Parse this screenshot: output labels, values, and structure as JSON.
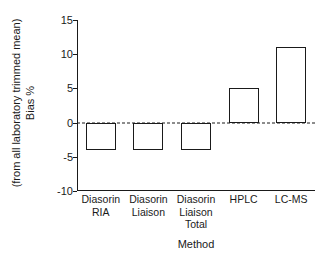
{
  "chart_data": {
    "type": "bar",
    "title": "",
    "xlabel": "Method",
    "ylabel_line1": "Bias %",
    "ylabel_line2": "(from all laboratory trimmed mean)",
    "categories": [
      "Diasorin RIA",
      "Diasorin Liaison",
      "Diasorin Liaison Total",
      "HPLC",
      "LC-MS"
    ],
    "category_lines": [
      [
        "Diasorin",
        "RIA"
      ],
      [
        "Diasorin",
        "Liaison"
      ],
      [
        "Diasorin",
        "Liaison",
        "Total"
      ],
      [
        "HPLC"
      ],
      [
        "LC-MS"
      ]
    ],
    "values": [
      -4,
      -4,
      -4,
      5,
      11
    ],
    "ylim": [
      -10,
      15
    ],
    "yticks": [
      15,
      10,
      5,
      0,
      -5,
      -10
    ],
    "ytick_labels": [
      "15",
      "10",
      "5",
      "0",
      "-5",
      "-10"
    ],
    "grid": false,
    "legend": "none",
    "zero_reference_line": {
      "value": 0,
      "style": "dashed",
      "color": "#1a1a1a"
    },
    "bar_style": {
      "fill": "#ffffff",
      "edge": "#1a1a1a"
    },
    "axis_color": "#1a1a1a",
    "background": "#ffffff"
  }
}
